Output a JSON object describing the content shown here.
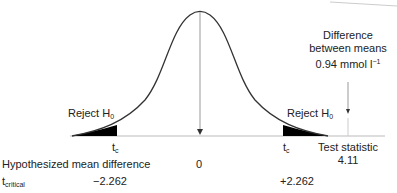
{
  "diagram": {
    "type": "t-distribution hypothesis test",
    "reject_left": {
      "text": "Reject H",
      "sub": "0"
    },
    "reject_right": {
      "text": "Reject H",
      "sub": "0"
    },
    "tc_left": {
      "text": "t",
      "sub": "c"
    },
    "tc_right": {
      "text": "t",
      "sub": "c"
    },
    "difference_label": {
      "line1": "Difference",
      "line2": "between means",
      "line3": "0.94 mmol l",
      "sup": "−1"
    },
    "test_statistic": {
      "label": "Test statistic",
      "value": "4.11"
    },
    "hypothesized_mean_difference": {
      "label": "Hypothesized mean difference",
      "value": "0"
    },
    "t_critical": {
      "label": "t",
      "sub": "critical",
      "left_value": "−2.262",
      "right_value": "+2.262"
    }
  },
  "colors": {
    "curve": "#333333",
    "axis": "#bbbbbb",
    "fill": "#000000",
    "arrow": "#888888"
  }
}
